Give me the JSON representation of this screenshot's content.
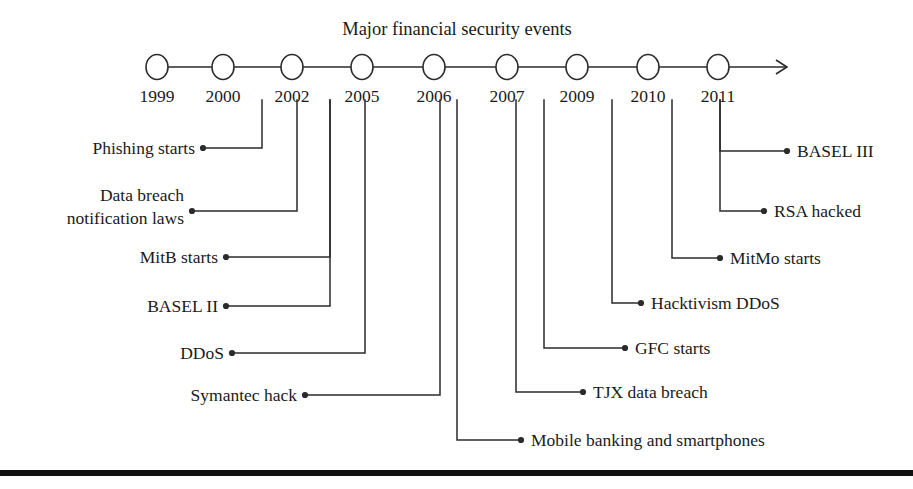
{
  "figure": {
    "title": "Major financial security events",
    "bottom_rule": true,
    "line_color": "#2b2b2b",
    "text_color": "#1a1a1a",
    "background": "#ffffff"
  },
  "timeline": {
    "axis_y": 67,
    "node_radius": 11,
    "arrow_tip_x": 787,
    "years": [
      {
        "label": "1999",
        "x": 157
      },
      {
        "label": "2000",
        "x": 223
      },
      {
        "label": "2002",
        "x": 292
      },
      {
        "label": "2005",
        "x": 362
      },
      {
        "label": "2006",
        "x": 434
      },
      {
        "label": "2007",
        "x": 507
      },
      {
        "label": "2009",
        "x": 577
      },
      {
        "label": "2010",
        "x": 648
      },
      {
        "label": "2011",
        "x": 718
      }
    ],
    "year_label_y": 102
  },
  "events": [
    {
      "id": "phishing-starts",
      "label": "Phishing starts",
      "year": "2000",
      "side": "left",
      "drop_x": 262,
      "row_y": 148,
      "dot_x": 203,
      "text_x": 195,
      "text_y": 154
    },
    {
      "id": "data-breach-notification-laws",
      "label": "Data breach notification laws",
      "label_line1": "Data breach",
      "label_line2": "notification laws",
      "year": "2002",
      "side": "left",
      "drop_x": 297,
      "row_y": 211,
      "dot_x": 192,
      "text_x": 184,
      "text_y1": 201,
      "text_y2": 224
    },
    {
      "id": "mitb-starts",
      "label": "MitB starts",
      "year": "2005",
      "side": "left",
      "drop_x": 330,
      "row_y": 257,
      "dot_x": 226,
      "text_x": 218,
      "text_y": 263
    },
    {
      "id": "basel-ii",
      "label": "BASEL II",
      "year": "2005",
      "side": "left",
      "drop_x": 330,
      "row_y": 306,
      "dot_x": 226,
      "text_x": 218,
      "text_y": 312
    },
    {
      "id": "ddos",
      "label": "DDoS",
      "year": "2005",
      "side": "left",
      "drop_x": 365,
      "row_y": 353,
      "dot_x": 232,
      "text_x": 224,
      "text_y": 359
    },
    {
      "id": "symantec-hack",
      "label": "Symantec hack",
      "year": "2006",
      "side": "left",
      "drop_x": 440,
      "row_y": 395,
      "dot_x": 305,
      "text_x": 297,
      "text_y": 401
    },
    {
      "id": "mobile-banking-and-smartphones",
      "label": "Mobile banking and smartphones",
      "year": "2006",
      "side": "right",
      "drop_x": 457,
      "row_y": 440,
      "dot_x": 521,
      "text_x": 531,
      "text_y": 446
    },
    {
      "id": "tjx-data-breach",
      "label": "TJX data breach",
      "year": "2007",
      "side": "right",
      "drop_x": 516,
      "row_y": 392,
      "dot_x": 583,
      "text_x": 593,
      "text_y": 398
    },
    {
      "id": "gfc-starts",
      "label": "GFC starts",
      "year": "2009",
      "side": "right",
      "drop_x": 544,
      "row_y": 348,
      "dot_x": 625,
      "text_x": 635,
      "text_y": 354
    },
    {
      "id": "hacktivism-ddos",
      "label": "Hacktivism DDoS",
      "year": "2010",
      "side": "right",
      "drop_x": 612,
      "row_y": 303,
      "dot_x": 641,
      "text_x": 651,
      "text_y": 309
    },
    {
      "id": "mitmo-starts",
      "label": "MitMo starts",
      "year": "2010",
      "side": "right",
      "drop_x": 672,
      "row_y": 258,
      "dot_x": 720,
      "text_x": 730,
      "text_y": 264
    },
    {
      "id": "rsa-hacked",
      "label": "RSA hacked",
      "year": "2011",
      "side": "right",
      "drop_x": 720,
      "row_y": 211,
      "dot_x": 764,
      "text_x": 774,
      "text_y": 217
    },
    {
      "id": "basel-iii",
      "label": "BASEL III",
      "year": "2011",
      "side": "right",
      "drop_x": 720,
      "row_y": 151,
      "dot_x": 787,
      "text_x": 797,
      "text_y": 157
    }
  ]
}
